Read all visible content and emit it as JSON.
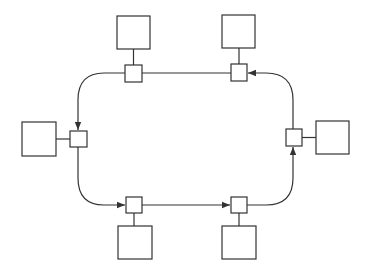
{
  "diagram": {
    "type": "ring-network",
    "colors": {
      "stroke": "#333333",
      "background": "#ffffff"
    },
    "direction": "counter-clockwise (arrows point left along top, down along left, right along bottom, up along right)",
    "nodes": [
      {
        "id": "n1",
        "position": "top-left",
        "junction": [
          125,
          65,
          17,
          17
        ],
        "station": [
          117,
          16,
          33,
          33
        ],
        "link": "vertical"
      },
      {
        "id": "n2",
        "position": "top-right",
        "junction": [
          231,
          64,
          16,
          17
        ],
        "station": [
          222,
          15,
          33,
          33
        ],
        "link": "vertical"
      },
      {
        "id": "n3",
        "position": "right",
        "junction": [
          286,
          129,
          16,
          17
        ],
        "station": [
          316,
          121,
          33,
          33
        ],
        "link": "horizontal"
      },
      {
        "id": "n4",
        "position": "bottom-right",
        "junction": [
          231,
          197,
          16,
          16
        ],
        "station": [
          222,
          226,
          34,
          33
        ],
        "link": "vertical"
      },
      {
        "id": "n5",
        "position": "bottom-left",
        "junction": [
          126,
          197,
          16,
          16
        ],
        "station": [
          118,
          226,
          34,
          33
        ],
        "link": "vertical"
      },
      {
        "id": "n6",
        "position": "left",
        "junction": [
          70,
          131,
          17,
          16
        ],
        "station": [
          22,
          122,
          34,
          34
        ],
        "link": "horizontal"
      }
    ],
    "edges": [
      {
        "from": "n2",
        "to": "n1",
        "arrow_at": "n2-side"
      },
      {
        "from": "n1",
        "to": "n6",
        "curve": "top-left corner"
      },
      {
        "from": "n6",
        "to": "n5",
        "curve": "bottom-left corner"
      },
      {
        "from": "n5",
        "to": "n4"
      },
      {
        "from": "n4",
        "to": "n3",
        "curve": "bottom-right corner"
      },
      {
        "from": "n3",
        "to": "n2",
        "curve": "top-right corner"
      }
    ]
  }
}
